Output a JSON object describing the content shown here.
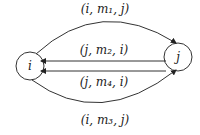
{
  "diagram": {
    "nodes": [
      {
        "id": "i",
        "label": "i",
        "x": 30,
        "y": 66
      },
      {
        "id": "j",
        "label": "j",
        "x": 178,
        "y": 57
      }
    ],
    "edges": [
      {
        "from": "i",
        "to": "j",
        "label": "(i, m₁, j)",
        "shape": "arc-top"
      },
      {
        "from": "j",
        "to": "i",
        "label": "(j, m₂, i)",
        "shape": "straight"
      },
      {
        "from": "j",
        "to": "i",
        "label": "(j, m₄, i)",
        "shape": "straight"
      },
      {
        "from": "i",
        "to": "j",
        "label": "(i, m₃, j)",
        "shape": "arc-bottom"
      }
    ]
  }
}
